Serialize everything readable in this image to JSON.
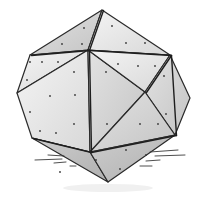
{
  "image": {
    "subject": "hand-drawn pencil sketch of a faceted polyhedron (climbing hold)",
    "background": "#ffffff",
    "colors": {
      "face_light": "#e9e9e9",
      "face_mid": "#d2d2d2",
      "face_dark": "#b9b9b9",
      "line": "#1e1e1e"
    }
  },
  "vertices": {
    "top": [
      102,
      10
    ],
    "ul": [
      30,
      55
    ],
    "hub": [
      88,
      50
    ],
    "ur": [
      170,
      55
    ],
    "left": [
      17,
      93
    ],
    "rc": [
      145,
      92
    ],
    "right": [
      190,
      98
    ],
    "ll": [
      32,
      138
    ],
    "bc": [
      90,
      152
    ],
    "lr": [
      175,
      135
    ],
    "bottom": [
      108,
      182
    ]
  },
  "faces": [
    {
      "pts": [
        "top",
        "ul",
        "hub"
      ],
      "shade": "face_mid"
    },
    {
      "pts": [
        "top",
        "hub",
        "ur"
      ],
      "shade": "face_light"
    },
    {
      "pts": [
        "ul",
        "left",
        "hub"
      ],
      "shade": "face_light"
    },
    {
      "pts": [
        "left",
        "ll",
        "bc",
        "hub"
      ],
      "shade": "face_light"
    },
    {
      "pts": [
        "hub",
        "bc",
        "rc"
      ],
      "shade": "face_mid"
    },
    {
      "pts": [
        "hub",
        "rc",
        "ur"
      ],
      "shade": "face_light"
    },
    {
      "pts": [
        "ur",
        "right",
        "lr",
        "rc"
      ],
      "shade": "face_mid"
    },
    {
      "pts": [
        "rc",
        "lr",
        "bc"
      ],
      "shade": "face_mid"
    },
    {
      "pts": [
        "ll",
        "bottom",
        "bc"
      ],
      "shade": "face_dark"
    },
    {
      "pts": [
        "bc",
        "bottom",
        "lr"
      ],
      "shade": "face_dark"
    }
  ],
  "dots": [
    [
      84,
      28
    ],
    [
      62,
      44
    ],
    [
      82,
      44
    ],
    [
      112,
      26
    ],
    [
      126,
      43
    ],
    [
      145,
      43
    ],
    [
      30,
      62
    ],
    [
      42,
      62
    ],
    [
      58,
      62
    ],
    [
      74,
      72
    ],
    [
      27,
      80
    ],
    [
      50,
      96
    ],
    [
      75,
      95
    ],
    [
      118,
      64
    ],
    [
      138,
      66
    ],
    [
      155,
      66
    ],
    [
      164,
      76
    ],
    [
      106,
      72
    ],
    [
      107,
      124
    ],
    [
      74,
      124
    ],
    [
      30,
      112
    ],
    [
      40,
      131
    ],
    [
      56,
      133
    ],
    [
      140,
      124
    ],
    [
      158,
      124
    ],
    [
      166,
      114
    ],
    [
      126,
      150
    ],
    [
      146,
      155
    ],
    [
      96,
      160
    ],
    [
      120,
      169
    ],
    [
      60,
      172
    ]
  ],
  "hatch_lines": [
    [
      [
        35,
        160
      ],
      [
        62,
        159
      ]
    ],
    [
      [
        48,
        155
      ],
      [
        64,
        156
      ]
    ],
    [
      [
        54,
        163
      ],
      [
        66,
        162
      ]
    ],
    [
      [
        70,
        166
      ],
      [
        76,
        166
      ]
    ],
    [
      [
        150,
        152
      ],
      [
        178,
        150
      ]
    ],
    [
      [
        155,
        156
      ],
      [
        185,
        155
      ]
    ],
    [
      [
        146,
        161
      ],
      [
        160,
        160
      ]
    ],
    [
      [
        140,
        166
      ],
      [
        152,
        166
      ]
    ]
  ]
}
